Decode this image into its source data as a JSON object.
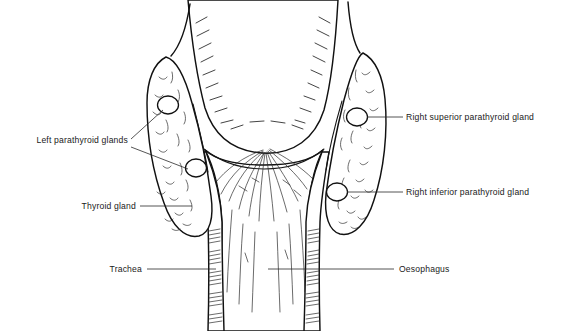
{
  "figure": {
    "background_color": "#ffffff",
    "line_color": "#111111",
    "text_color": "#1a1a1a"
  },
  "labels": {
    "left_parathyroid": {
      "text": "Left parathyroid glands",
      "side": "left",
      "x": 128,
      "y": 143
    },
    "thyroid": {
      "text": "Thyroid gland",
      "side": "left",
      "x": 136,
      "y": 209
    },
    "trachea": {
      "text": "Trachea",
      "side": "left",
      "x": 142,
      "y": 272
    },
    "right_superior_parathyroid": {
      "text": "Right superior parathyroid gland",
      "side": "right",
      "x": 406,
      "y": 119
    },
    "right_inferior_parathyroid": {
      "text": "Right inferior parathyroid gland",
      "side": "right",
      "x": 406,
      "y": 195
    },
    "oesophagus": {
      "text": "Oesophagus",
      "side": "right",
      "x": 399,
      "y": 272
    }
  },
  "structures": {
    "left_lobe": "Left thyroid lobe",
    "right_lobe": "Right thyroid lobe",
    "pharynx": "Pharyngeal constrictor muscles",
    "oesophagus_body": "Oesophagus",
    "trachea_body": "Trachea with cartilage rings",
    "parathyroid_left_superior": "Left superior parathyroid gland",
    "parathyroid_left_inferior": "Left inferior parathyroid gland",
    "parathyroid_right_superior": "Right superior parathyroid gland",
    "parathyroid_right_inferior": "Right inferior parathyroid gland"
  }
}
